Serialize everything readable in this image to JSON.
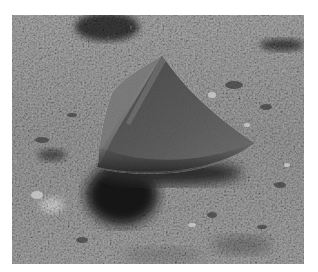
{
  "image": {
    "subject": "grey cone-shaped object resting on gravelly ground",
    "style": "grayscale photograph",
    "colors": {
      "background": "#ffffff",
      "ground_mid": "#8e8e8e",
      "ground_light": "#b5b5b5",
      "cone_light_face": "#7a7a7a",
      "cone_dark_face": "#565656",
      "shadow": "#1e1e1e"
    }
  }
}
